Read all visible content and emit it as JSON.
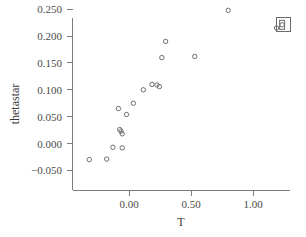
{
  "chart_data": {
    "type": "scatter",
    "title": "",
    "xlabel": "T",
    "ylabel": "thetastar",
    "xlim": [
      -0.42,
      1.3
    ],
    "ylim": [
      -0.068,
      0.268
    ],
    "grid": false,
    "legend": null,
    "xticks": [
      0.0,
      0.5,
      1.0
    ],
    "xtick_labels": [
      "0.00",
      "0.50",
      "1.00"
    ],
    "yticks": [
      -0.05,
      0.0,
      0.05,
      0.1,
      0.15,
      0.2,
      0.25
    ],
    "ytick_labels": [
      "-0.050",
      "0.000",
      "0.050",
      "0.100",
      "0.150",
      "0.200",
      "0.250"
    ],
    "marker": "open-circle",
    "marker_color": "#6e6e6e",
    "points": [
      {
        "x": -0.32,
        "y": -0.03
      },
      {
        "x": -0.18,
        "y": -0.029
      },
      {
        "x": -0.13,
        "y": -0.007
      },
      {
        "x": -0.055,
        "y": -0.008
      },
      {
        "x": -0.075,
        "y": 0.026
      },
      {
        "x": -0.065,
        "y": 0.023
      },
      {
        "x": -0.055,
        "y": 0.018
      },
      {
        "x": -0.085,
        "y": 0.065
      },
      {
        "x": -0.02,
        "y": 0.054
      },
      {
        "x": 0.035,
        "y": 0.075
      },
      {
        "x": 0.115,
        "y": 0.1
      },
      {
        "x": 0.185,
        "y": 0.11
      },
      {
        "x": 0.225,
        "y": 0.109
      },
      {
        "x": 0.245,
        "y": 0.106
      },
      {
        "x": 0.265,
        "y": 0.16
      },
      {
        "x": 0.295,
        "y": 0.19
      },
      {
        "x": 0.53,
        "y": 0.162
      },
      {
        "x": 0.8,
        "y": 0.248
      },
      {
        "x": 1.19,
        "y": 0.215
      },
      {
        "x": 1.235,
        "y": 0.221
      }
    ],
    "annotation": {
      "label": "boxed-marker-group",
      "x": 1.235,
      "y": 0.221,
      "box_width_px": 14,
      "box_height_px": 14
    }
  },
  "axes": {
    "x_axis_name": "T",
    "y_axis_name": "thetastar"
  }
}
